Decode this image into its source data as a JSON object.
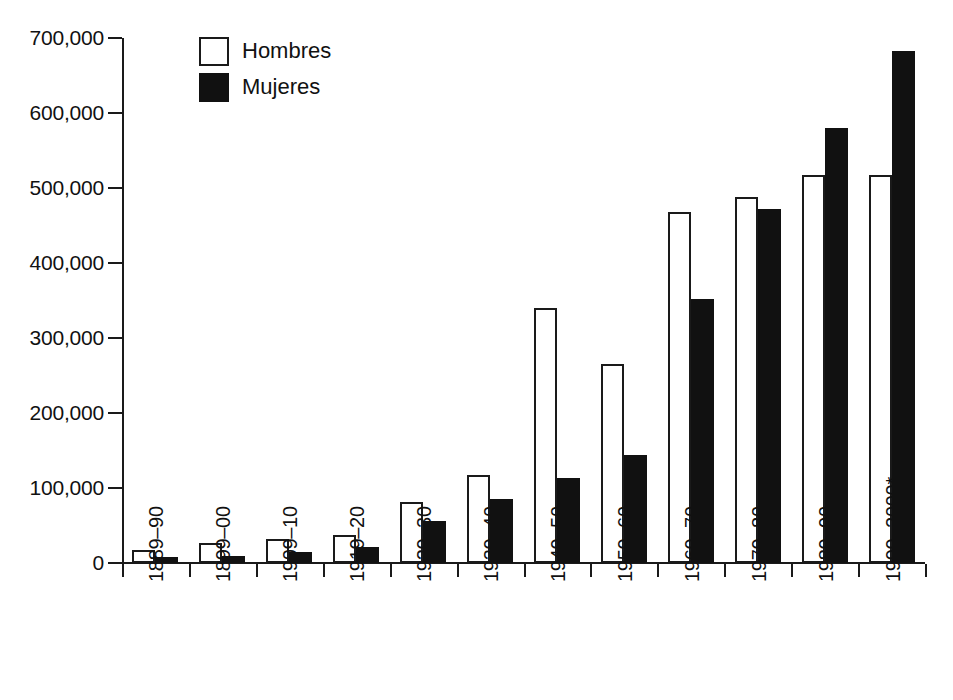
{
  "chart_data": {
    "type": "bar",
    "title": "",
    "subtitle": "",
    "xlabel": "",
    "ylabel": "",
    "grid": false,
    "legend_position": "top-left",
    "ylim": [
      0,
      700000
    ],
    "ytick_interval": 100000,
    "ytick_labels": [
      "0",
      "100,000",
      "200,000",
      "300,000",
      "400,000",
      "500,000",
      "600,000",
      "700,000"
    ],
    "ytick_values": [
      0,
      100000,
      200000,
      300000,
      400000,
      500000,
      600000,
      700000
    ],
    "categories": [
      "1889–90",
      "1899–00",
      "1909–10",
      "1919–20",
      "1929–30",
      "1939–40",
      "1949–50",
      "1959–60",
      "1969–70",
      "1979–80",
      "1989–90",
      "1999–2000*"
    ],
    "series": [
      {
        "name": "Hombres",
        "color": "#ffffff",
        "edge_color": "#1a1a1a",
        "values": [
          18000,
          27000,
          32000,
          38000,
          82000,
          117000,
          340000,
          266000,
          468000,
          488000,
          518000,
          517000
        ]
      },
      {
        "name": "Mujeres",
        "color": "#111111",
        "edge_color": "#111111",
        "values": [
          8000,
          10000,
          15000,
          21000,
          56000,
          86000,
          113000,
          144000,
          352000,
          472000,
          580000,
          683000
        ]
      }
    ],
    "annotations": []
  },
  "legend": {
    "items": [
      {
        "label": "Hombres",
        "swatch": "open-square"
      },
      {
        "label": "Mujeres",
        "swatch": "filled-square"
      }
    ]
  }
}
